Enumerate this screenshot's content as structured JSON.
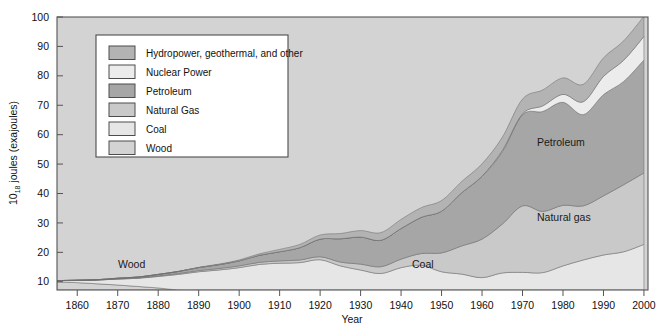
{
  "figure": {
    "background": "#ffffff",
    "plot_background": "#d3d3d3",
    "frame_color": "#555555"
  },
  "axes": {
    "y_title_prefix": "10",
    "y_title_exp": "18",
    "y_title_suffix": " joules (exajoules)",
    "y_title_full": "10 18 joules (exajoules)",
    "x_title": "Year",
    "y_ticks": [
      "10",
      "20",
      "30",
      "40",
      "50",
      "60",
      "70",
      "80",
      "90",
      "100"
    ],
    "x_ticks": [
      "1860",
      "1870",
      "1880",
      "1890",
      "1900",
      "1910",
      "1920",
      "1930",
      "1940",
      "1950",
      "1960",
      "1970",
      "1980",
      "1990",
      "2000"
    ]
  },
  "legend": {
    "border_color": "#4d4d4d",
    "background": "#ffffff",
    "items": [
      {
        "label": "Hydropower, geothermal, and other",
        "color": "#b3b3b3"
      },
      {
        "label": "Nuclear Power",
        "color": "#ececec"
      },
      {
        "label": "Petroleum",
        "color": "#a6a6a6"
      },
      {
        "label": "Natural Gas",
        "color": "#c9c9c9"
      },
      {
        "label": "Coal",
        "color": "#e6e6e6"
      },
      {
        "label": "Wood",
        "color": "#d3d3d3"
      }
    ]
  },
  "annotations": [
    {
      "text": "Wood",
      "x": 118,
      "y": 268
    },
    {
      "text": "Coal",
      "x": 412,
      "y": 268
    },
    {
      "text": "Petroleum",
      "x": 537,
      "y": 146
    },
    {
      "text": "Natural gas",
      "x": 537,
      "y": 221
    }
  ],
  "chart_data": {
    "type": "area",
    "stacked": true,
    "title": "",
    "xlabel": "Year",
    "ylabel": "10^18 joules (exajoules)",
    "xlim": [
      1855,
      2001
    ],
    "ylim": [
      7.2,
      100
    ],
    "grid": false,
    "legend_position": "upper-left-inside",
    "units": "exajoules (10^18 joules)",
    "x": [
      1855,
      1860,
      1865,
      1870,
      1875,
      1880,
      1885,
      1890,
      1895,
      1900,
      1905,
      1910,
      1915,
      1920,
      1925,
      1930,
      1935,
      1940,
      1945,
      1950,
      1955,
      1960,
      1965,
      1970,
      1975,
      1980,
      1985,
      1990,
      1995,
      2000
    ],
    "series": [
      {
        "name": "Wood",
        "color": "#d3d3d3",
        "values": [
          10.0,
          9.7,
          9.3,
          8.9,
          8.4,
          7.9,
          7.2,
          6.4,
          5.4,
          4.2,
          2.6,
          0.9,
          0.2,
          0.0,
          0.0,
          0.0,
          0.0,
          0.0,
          0.0,
          0.0,
          0.0,
          0.0,
          0.0,
          0.0,
          0.0,
          0.0,
          0.0,
          0.0,
          0.0,
          0.0
        ]
      },
      {
        "name": "Coal",
        "color": "#e6e6e6",
        "values": [
          0.4,
          0.8,
          1.3,
          2.0,
          2.8,
          3.9,
          5.3,
          7.0,
          8.6,
          10.6,
          13.3,
          15.4,
          16.3,
          17.5,
          15.4,
          14.0,
          12.8,
          14.8,
          15.6,
          13.4,
          12.6,
          11.4,
          13.0,
          13.2,
          13.1,
          15.4,
          17.4,
          19.1,
          20.2,
          22.7
        ]
      },
      {
        "name": "Natural Gas",
        "color": "#c9c9c9",
        "values": [
          0.0,
          0.0,
          0.0,
          0.1,
          0.1,
          0.2,
          0.3,
          0.4,
          0.5,
          0.6,
          0.7,
          0.8,
          0.9,
          1.0,
          1.3,
          2.0,
          2.3,
          2.9,
          4.0,
          6.4,
          9.6,
          13.1,
          16.6,
          22.6,
          20.8,
          20.6,
          18.4,
          20.1,
          22.8,
          24.3
        ]
      },
      {
        "name": "Petroleum",
        "color": "#a6a6a6",
        "values": [
          0.0,
          0.0,
          0.1,
          0.2,
          0.3,
          0.5,
          0.7,
          1.0,
          1.3,
          1.7,
          2.4,
          3.1,
          4.2,
          6.0,
          7.9,
          9.2,
          9.0,
          10.4,
          12.3,
          14.2,
          18.1,
          21.3,
          24.6,
          31.0,
          34.0,
          35.0,
          31.0,
          34.4,
          35.1,
          38.4
        ]
      },
      {
        "name": "Nuclear Power",
        "color": "#ececec",
        "values": [
          0.0,
          0.0,
          0.0,
          0.0,
          0.0,
          0.0,
          0.0,
          0.0,
          0.0,
          0.0,
          0.0,
          0.0,
          0.0,
          0.0,
          0.0,
          0.0,
          0.0,
          0.0,
          0.0,
          0.0,
          0.0,
          0.1,
          0.4,
          0.3,
          1.9,
          2.7,
          4.4,
          6.2,
          7.2,
          8.0
        ]
      },
      {
        "name": "Hydropower, geothermal, and other",
        "color": "#b3b3b3",
        "values": [
          0.0,
          0.0,
          0.0,
          0.0,
          0.0,
          0.0,
          0.0,
          0.1,
          0.2,
          0.3,
          0.5,
          0.8,
          1.1,
          1.4,
          1.8,
          2.2,
          2.6,
          3.1,
          3.3,
          3.6,
          3.8,
          4.2,
          4.5,
          5.0,
          5.4,
          5.6,
          5.9,
          6.3,
          6.6,
          6.9
        ]
      }
    ],
    "totals": [
      10.4,
      10.5,
      10.7,
      11.2,
      11.6,
      12.5,
      13.5,
      14.9,
      16.0,
      17.4,
      19.5,
      21.0,
      22.7,
      25.9,
      26.4,
      27.4,
      26.7,
      31.2,
      35.2,
      37.6,
      44.1,
      50.1,
      59.1,
      72.1,
      75.2,
      79.3,
      77.1,
      86.1,
      91.9,
      100.3
    ]
  }
}
